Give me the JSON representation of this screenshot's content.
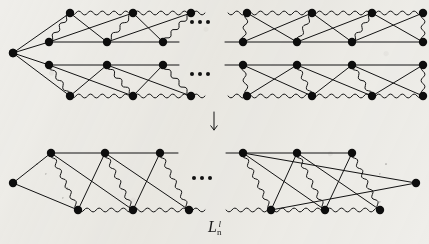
{
  "figure": {
    "kind": "ladder-diagram",
    "background_color": "#efeeea",
    "ink_color": "#121212",
    "node_color": "#0d0d0d",
    "node_radius": 4.2,
    "line_width": 1.0,
    "wave_amplitude": 2.0,
    "wave_period": 6.0,
    "caption": "L",
    "caption_sub": "n",
    "caption_sup": "l",
    "arrow": {
      "label": "down-arrow",
      "x": 214,
      "y": 112,
      "length": 18
    },
    "ellipses": [
      {
        "name": "ellipsis-top-upper",
        "x": 201,
        "y": 22
      },
      {
        "name": "ellipsis-top-lower",
        "x": 201,
        "y": 74
      },
      {
        "name": "ellipsis-bottom",
        "x": 203,
        "y": 178
      }
    ],
    "faint_edge_labels": [
      {
        "text": "u",
        "x": 36,
        "y": 162
      },
      {
        "text": "v",
        "x": 45,
        "y": 172
      },
      {
        "text": "u",
        "x": 66,
        "y": 186
      },
      {
        "text": "v",
        "x": 62,
        "y": 196
      },
      {
        "text": "u",
        "x": 385,
        "y": 162
      },
      {
        "text": "v",
        "x": 379,
        "y": 172
      },
      {
        "text": "u",
        "x": 371,
        "y": 190
      },
      {
        "text": "v",
        "x": 379,
        "y": 200
      }
    ],
    "panels": [
      {
        "name": "top-panel",
        "sub_rows": [
          {
            "name": "top-row-upper-left",
            "apex": {
              "x": 13,
              "y": 53
            },
            "top_nodes": [
              {
                "x": 70,
                "y": 13
              },
              {
                "x": 133,
                "y": 13
              },
              {
                "x": 191,
                "y": 13
              }
            ],
            "bottom_nodes": [
              {
                "x": 49,
                "y": 42
              },
              {
                "x": 107,
                "y": 42
              },
              {
                "x": 163,
                "y": 42
              }
            ],
            "top_rail": {
              "x1": 70,
              "y1": 13,
              "x2": 205,
              "y2": 13,
              "style": "wavy"
            },
            "bottom_rail": {
              "x1": 49,
              "y1": 42,
              "x2": 179,
              "y2": 42,
              "style": "straight"
            }
          },
          {
            "name": "top-row-upper-right",
            "top_nodes": [
              {
                "x": 247,
                "y": 13
              },
              {
                "x": 312,
                "y": 13
              },
              {
                "x": 372,
                "y": 13
              },
              {
                "x": 423,
                "y": 13
              }
            ],
            "bottom_nodes": [
              {
                "x": 243,
                "y": 42
              },
              {
                "x": 297,
                "y": 42
              },
              {
                "x": 352,
                "y": 42
              },
              {
                "x": 423,
                "y": 42
              }
            ],
            "top_rail": {
              "x1": 228,
              "y1": 13,
              "x2": 423,
              "y2": 13,
              "style": "wavy"
            },
            "bottom_rail": {
              "x1": 225,
              "y1": 42,
              "x2": 423,
              "y2": 42,
              "style": "straight"
            }
          },
          {
            "name": "top-row-lower-left",
            "apex": {
              "x": 13,
              "y": 53
            },
            "top_nodes": [
              {
                "x": 49,
                "y": 65
              },
              {
                "x": 107,
                "y": 65
              },
              {
                "x": 163,
                "y": 65
              }
            ],
            "bottom_nodes": [
              {
                "x": 70,
                "y": 96
              },
              {
                "x": 133,
                "y": 96
              },
              {
                "x": 191,
                "y": 96
              }
            ],
            "top_rail": {
              "x1": 49,
              "y1": 65,
              "x2": 179,
              "y2": 65,
              "style": "straight"
            },
            "bottom_rail": {
              "x1": 70,
              "y1": 96,
              "x2": 205,
              "y2": 96,
              "style": "wavy"
            }
          },
          {
            "name": "top-row-lower-right",
            "top_nodes": [
              {
                "x": 243,
                "y": 65
              },
              {
                "x": 297,
                "y": 65
              },
              {
                "x": 352,
                "y": 65
              },
              {
                "x": 423,
                "y": 65
              }
            ],
            "bottom_nodes": [
              {
                "x": 247,
                "y": 96
              },
              {
                "x": 312,
                "y": 96
              },
              {
                "x": 372,
                "y": 96
              },
              {
                "x": 423,
                "y": 96
              }
            ],
            "top_rail": {
              "x1": 225,
              "y1": 65,
              "x2": 423,
              "y2": 65,
              "style": "straight"
            },
            "bottom_rail": {
              "x1": 228,
              "y1": 96,
              "x2": 423,
              "y2": 96,
              "style": "wavy"
            }
          }
        ]
      },
      {
        "name": "bottom-panel",
        "sub_rows": [
          {
            "name": "bottom-row-left",
            "apex": {
              "x": 13,
              "y": 183
            },
            "top_nodes": [
              {
                "x": 51,
                "y": 153
              },
              {
                "x": 105,
                "y": 153
              },
              {
                "x": 160,
                "y": 153
              }
            ],
            "bottom_nodes": [
              {
                "x": 78,
                "y": 210
              },
              {
                "x": 133,
                "y": 210
              },
              {
                "x": 189,
                "y": 210
              }
            ],
            "top_rail": {
              "x1": 51,
              "y1": 153,
              "x2": 178,
              "y2": 153,
              "style": "straight"
            },
            "bottom_rail": {
              "x1": 78,
              "y1": 210,
              "x2": 205,
              "y2": 210,
              "style": "wavy"
            }
          },
          {
            "name": "bottom-row-right",
            "apex": {
              "x": 416,
              "y": 183
            },
            "top_nodes": [
              {
                "x": 243,
                "y": 153
              },
              {
                "x": 297,
                "y": 153
              },
              {
                "x": 352,
                "y": 153
              }
            ],
            "bottom_nodes": [
              {
                "x": 271,
                "y": 210
              },
              {
                "x": 325,
                "y": 210
              },
              {
                "x": 380,
                "y": 210
              }
            ],
            "top_rail": {
              "x1": 226,
              "y1": 153,
              "x2": 352,
              "y2": 153,
              "style": "straight"
            },
            "bottom_rail": {
              "x1": 226,
              "y1": 210,
              "x2": 380,
              "y2": 210,
              "style": "wavy"
            }
          }
        ]
      }
    ]
  }
}
